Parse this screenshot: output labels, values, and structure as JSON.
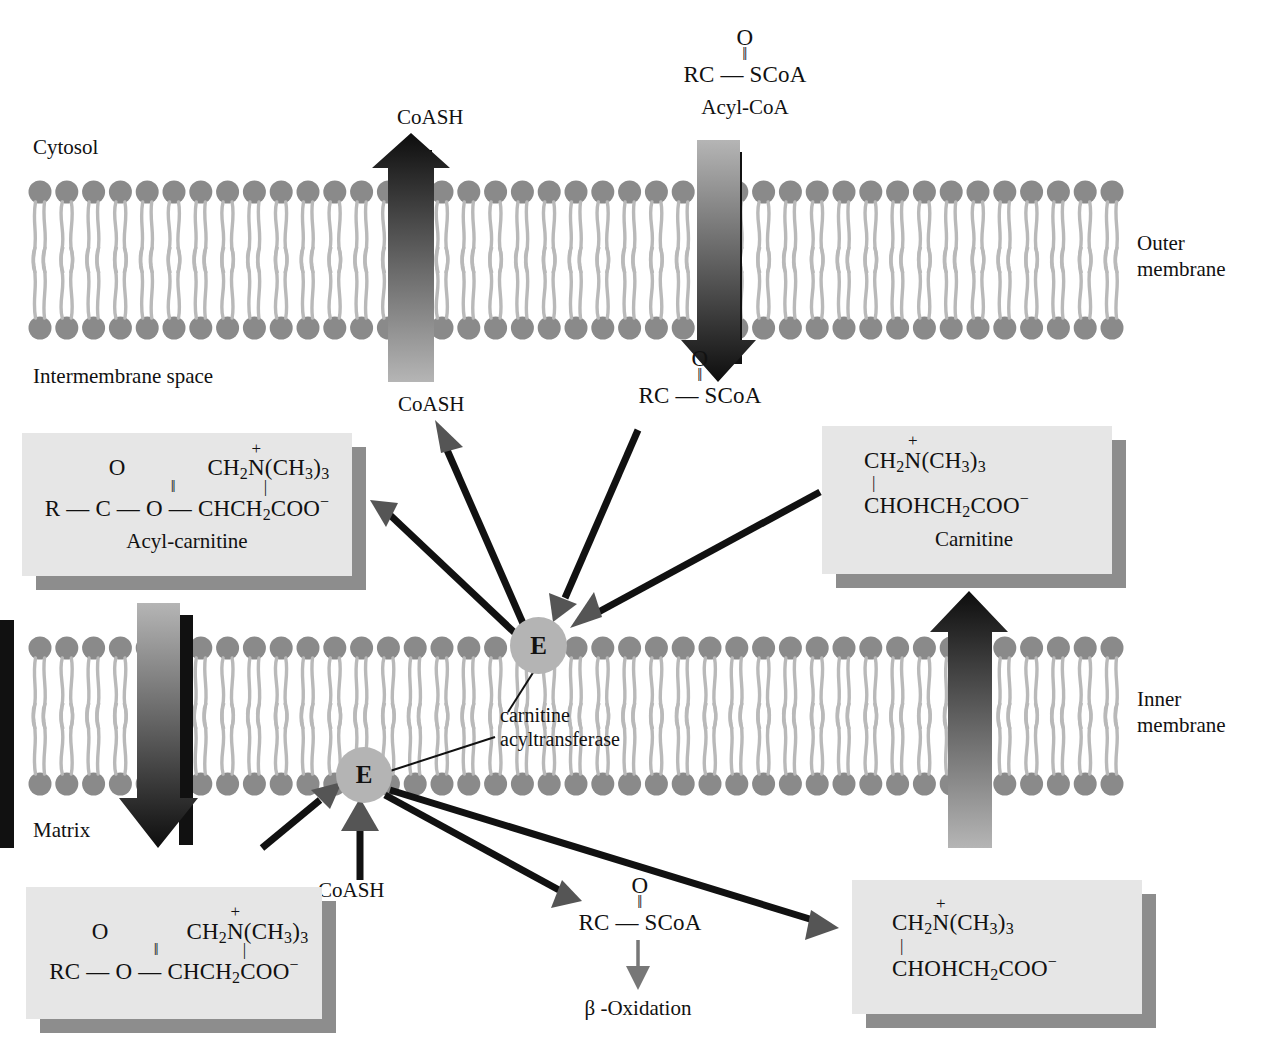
{
  "diagram": {
    "compartments": [
      {
        "id": "cytosol",
        "label": "Cytosol"
      },
      {
        "id": "intermembrane",
        "label": "Intermembrane space"
      },
      {
        "id": "matrix",
        "label": "Matrix"
      }
    ],
    "membranes": [
      {
        "id": "outer",
        "line1": "Outer",
        "line2": "membrane"
      },
      {
        "id": "inner",
        "line1": "Inner",
        "line2": "membrane"
      }
    ],
    "enzyme": {
      "symbol": "E",
      "label_line1": "carnitine",
      "label_line2": "acyltransferase"
    },
    "labels": {
      "coash_top": "CoASH",
      "coash_intermembrane": "CoASH",
      "coash_matrix": "CoASH",
      "acyl_coa_name": "Acyl-CoA",
      "acyl_carnitine_name": "Acyl-carnitine",
      "carnitine_name": "Carnitine",
      "beta_oxidation": "β -Oxidation"
    },
    "molecules": {
      "acyl_coa_top": {
        "oxygen": "O",
        "double_bond": "‖",
        "backbone_left": "RC",
        "bond": "—",
        "backbone_right": "SCoA"
      },
      "acyl_coa_intermembrane": {
        "oxygen": "O",
        "double_bond": "‖",
        "backbone_left": "RC",
        "bond": "—",
        "backbone_right": "SCoA"
      },
      "acyl_coa_matrix": {
        "oxygen": "O",
        "double_bond": "‖",
        "backbone_left": "RC",
        "bond": "—",
        "backbone_right": "SCoA"
      },
      "acyl_carnitine_cytosolic": {
        "oxygen": "O",
        "double_bond": "‖",
        "branch_head": "CH",
        "branch_head_sub": "2",
        "branch_n": "N",
        "branch_charge": "+",
        "branch_tail": "(CH",
        "branch_tail_sub": "3",
        "branch_tail_end": ")",
        "branch_tail_end_sub": "3",
        "vertical_bond": "|",
        "main_chain": "R — C — O — CHCH",
        "main_chain_sub": "2",
        "main_chain_end": "COO",
        "main_chain_charge": "−"
      },
      "acyl_carnitine_matrix": {
        "oxygen": "O",
        "double_bond": "‖",
        "branch_head": "CH",
        "branch_head_sub": "2",
        "branch_n": "N",
        "branch_charge": "+",
        "branch_tail": "(CH",
        "branch_tail_sub": "3",
        "branch_tail_end": ")",
        "branch_tail_end_sub": "3",
        "vertical_bond": "|",
        "main_chain": "RC — O — CHCH",
        "main_chain_sub": "2",
        "main_chain_end": "COO",
        "main_chain_charge": "−"
      },
      "carnitine_intermembrane": {
        "branch_head": "CH",
        "branch_head_sub": "2",
        "branch_n": "N",
        "branch_charge": "+",
        "branch_tail": "(CH",
        "branch_tail_sub": "3",
        "branch_tail_end": ")",
        "branch_tail_end_sub": "3",
        "vertical_bond": "|",
        "main_chain": "CHOHCH",
        "main_chain_sub": "2",
        "main_chain_end": "COO",
        "main_chain_charge": "−"
      },
      "carnitine_matrix": {
        "branch_head": "CH",
        "branch_head_sub": "2",
        "branch_n": "N",
        "branch_charge": "+",
        "branch_tail": "(CH",
        "branch_tail_sub": "3",
        "branch_tail_end": ")",
        "branch_tail_end_sub": "3",
        "vertical_bond": "|",
        "main_chain": "CHOHCH",
        "main_chain_sub": "2",
        "main_chain_end": "COO",
        "main_chain_charge": "−"
      }
    },
    "colors": {
      "lipid_head": "#8a8a8a",
      "lipid_tail": "#b9b9b9",
      "enzyme_fill": "#b4b4b4",
      "box_fill": "#e6e6e6",
      "box_shadow": "#8d8d8d",
      "arrow_dark": "#111111",
      "arrow_head_gray": "#555555",
      "text": "#111111"
    }
  }
}
